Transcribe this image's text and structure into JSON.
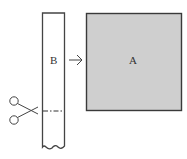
{
  "diagram": {
    "strip": {
      "label": "B",
      "fill": "#ffffff",
      "stroke": "#444444"
    },
    "square": {
      "label": "A",
      "fill": "#cfcfcf",
      "stroke": "#3a3a3a"
    },
    "arrow": {
      "direction": "right",
      "from": "B",
      "to": "A"
    },
    "cut_line": {
      "style": "dash-dot"
    },
    "scissors": {
      "icon": "scissors-icon"
    }
  }
}
